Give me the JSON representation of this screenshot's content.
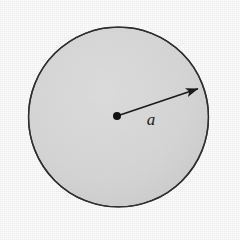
{
  "figure": {
    "caption": "",
    "background_color": "#fbfbfb",
    "width": 240,
    "height": 240
  },
  "diagram": {
    "type": "geometry-diagram",
    "shape": {
      "name": "circle",
      "center_x": 118.5,
      "center_y": 117,
      "radius": 90,
      "fill_color": "#d2d2d2",
      "fill_color_light": "#dcdcdc",
      "stroke_color": "#2e2e2e",
      "stroke_width": 1.4
    },
    "center_point": {
      "name": "center-dot",
      "x": 117,
      "y": 116,
      "radius": 4,
      "color": "#111111"
    },
    "radius_arrow": {
      "name": "radius-arrow",
      "start_x": 117,
      "start_y": 116,
      "end_x": 200,
      "end_y": 88,
      "stroke_color": "#1a1a1a",
      "stroke_width": 1.6,
      "arrowhead": "triangle"
    },
    "labels": [
      {
        "name": "radius-label",
        "text": "a",
        "x": 151,
        "y": 125,
        "style": "italic-serif",
        "color": "#1a1a1a"
      }
    ]
  }
}
